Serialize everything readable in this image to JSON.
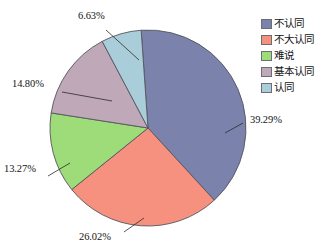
{
  "chart_data": {
    "type": "pie",
    "title": "",
    "labels": [
      "不认同",
      "不大认同",
      "难说",
      "基本认同",
      "认同"
    ],
    "values": [
      39.29,
      26.02,
      13.27,
      14.8,
      6.63
    ],
    "value_labels": [
      "39.29%",
      "26.02%",
      "13.27%",
      "14.80%",
      "6.63%"
    ],
    "units": "percent",
    "colors": [
      "#7b82ab",
      "#f7917f",
      "#9edb79",
      "#bfa8b8",
      "#a9cdd9"
    ],
    "legend_position": "right",
    "grid": false,
    "start_angle_deg": -4,
    "direction": "clockwise"
  },
  "legend": {
    "items": [
      {
        "label": "不认同",
        "color": "#7b82ab"
      },
      {
        "label": "不大认同",
        "color": "#f7917f"
      },
      {
        "label": "难说",
        "color": "#9edb79"
      },
      {
        "label": "基本认同",
        "color": "#bfa8b8"
      },
      {
        "label": "认同",
        "color": "#a9cdd9"
      }
    ]
  },
  "callouts": [
    {
      "text": "39.29%"
    },
    {
      "text": "26.02%"
    },
    {
      "text": "13.27%"
    },
    {
      "text": "14.80%"
    },
    {
      "text": "6.63%"
    }
  ]
}
